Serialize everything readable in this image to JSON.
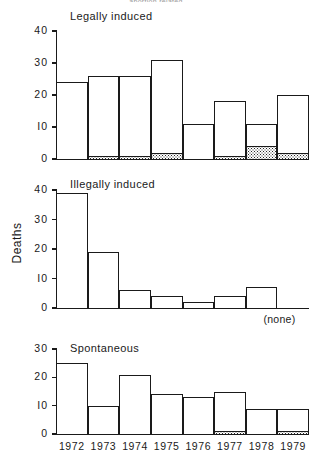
{
  "figure": {
    "clipped_top_text": "abortion related",
    "ylabel": "Deaths",
    "none_label": "(none)"
  },
  "chart_data": {
    "type": "bar",
    "xlabel": "",
    "ylabel": "Deaths",
    "categories": [
      "1972",
      "1973",
      "1974",
      "1975",
      "1976",
      "1977",
      "1978",
      "1979"
    ],
    "grid": false,
    "legend": "none",
    "panels": [
      {
        "name": "legally-induced",
        "title": "Legally induced",
        "ylim": [
          0,
          40
        ],
        "yticks": [
          0,
          10,
          20,
          30,
          40
        ],
        "ytick_labels": [
          "0",
          "I0",
          "20",
          "30",
          "40"
        ],
        "series": [
          {
            "name": "total",
            "values": [
              24,
              26,
              26,
              31,
              11,
              18,
              11,
              20
            ]
          },
          {
            "name": "stippled-base",
            "values": [
              0,
              1,
              1,
              2,
              0,
              1,
              4,
              2
            ]
          }
        ]
      },
      {
        "name": "illegally-induced",
        "title": "Illegally induced",
        "ylim": [
          0,
          40
        ],
        "yticks": [
          0,
          10,
          20,
          30,
          40
        ],
        "ytick_labels": [
          "0",
          "I0",
          "20",
          "30",
          "40"
        ],
        "series": [
          {
            "name": "total",
            "values": [
              39,
              19,
              6,
              4,
              2,
              4,
              7,
              null
            ]
          },
          {
            "name": "stippled-base",
            "values": [
              0,
              0,
              0,
              0,
              0,
              0,
              0,
              0
            ]
          }
        ],
        "annotation": "(none)"
      },
      {
        "name": "spontaneous",
        "title": "Spontaneous",
        "ylim": [
          0,
          30
        ],
        "yticks": [
          0,
          10,
          20,
          30
        ],
        "ytick_labels": [
          "0",
          "I0",
          "20",
          "30"
        ],
        "series": [
          {
            "name": "total",
            "values": [
              25,
              10,
              21,
              14,
              13,
              15,
              9,
              9
            ]
          },
          {
            "name": "stippled-base",
            "values": [
              0,
              0,
              0,
              0,
              0,
              1,
              0,
              1
            ]
          }
        ]
      }
    ]
  },
  "colors": {
    "ink": "#1a1a1a",
    "paper": "#ffffff"
  }
}
